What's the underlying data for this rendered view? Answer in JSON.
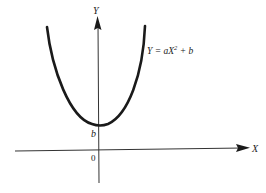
{
  "diagram": {
    "type": "function-graph",
    "curve": {
      "equation_prefix": "Y = ",
      "equation_a": "a",
      "equation_X": "X",
      "equation_exp": "2",
      "equation_suffix": " + b",
      "equation_full": "Y = aX² + b",
      "shape": "upward parabola",
      "color": "#1a1a1a"
    },
    "axes": {
      "x_label": "X",
      "y_label": "Y",
      "origin_label": "0",
      "intercept_label": "b",
      "color": "#333333"
    }
  }
}
